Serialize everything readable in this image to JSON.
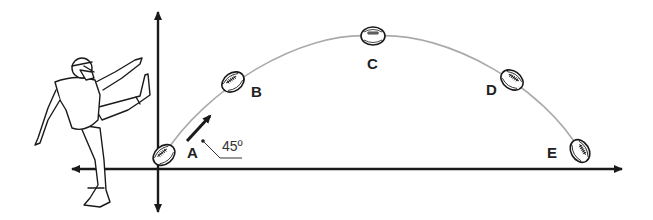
{
  "diagram": {
    "points": [
      {
        "id": "A",
        "label": "A",
        "ball": {
          "x": 164,
          "y": 155,
          "angle": -40
        },
        "text": {
          "x": 187,
          "y": 158
        }
      },
      {
        "id": "B",
        "label": "B",
        "ball": {
          "x": 233,
          "y": 82,
          "angle": -35
        },
        "text": {
          "x": 251,
          "y": 97
        }
      },
      {
        "id": "C",
        "label": "C",
        "ball": {
          "x": 373,
          "y": 36,
          "angle": 0
        },
        "text": {
          "x": 367,
          "y": 69
        }
      },
      {
        "id": "D",
        "label": "D",
        "ball": {
          "x": 512,
          "y": 80,
          "angle": 35
        },
        "text": {
          "x": 486,
          "y": 95
        }
      },
      {
        "id": "E",
        "label": "E",
        "ball": {
          "x": 580,
          "y": 151,
          "angle": 60
        },
        "text": {
          "x": 547,
          "y": 158
        }
      }
    ],
    "launch_angle": {
      "label": "45º",
      "value": 45,
      "unit": "degrees"
    },
    "axes": {
      "horizontal": "bidirectional",
      "vertical": "bidirectional"
    },
    "figure": "kicker"
  },
  "colors": {
    "axis": "#1a1a1a",
    "trajectory": "#aaaaaa",
    "ink": "#222222",
    "background": "#ffffff"
  }
}
